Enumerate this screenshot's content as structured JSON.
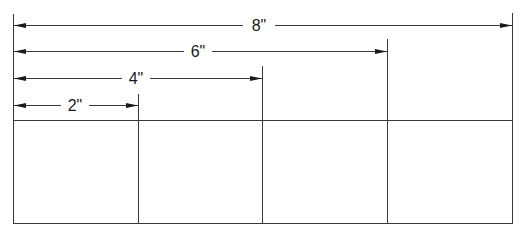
{
  "diagram": {
    "colors": {
      "line": "#3a3a3a",
      "arrow": "#1a1a1a",
      "text": "#1a1a1a",
      "background": "#ffffff"
    },
    "dimensions": [
      {
        "label": "8\"",
        "value_in": 8
      },
      {
        "label": "6\"",
        "value_in": 6
      },
      {
        "label": "4\"",
        "value_in": 4
      },
      {
        "label": "2\"",
        "value_in": 2
      }
    ],
    "segments": [
      {
        "index": 1,
        "width_in": 2
      },
      {
        "index": 2,
        "width_in": 2
      },
      {
        "index": 3,
        "width_in": 2
      },
      {
        "index": 4,
        "width_in": 2
      }
    ]
  }
}
